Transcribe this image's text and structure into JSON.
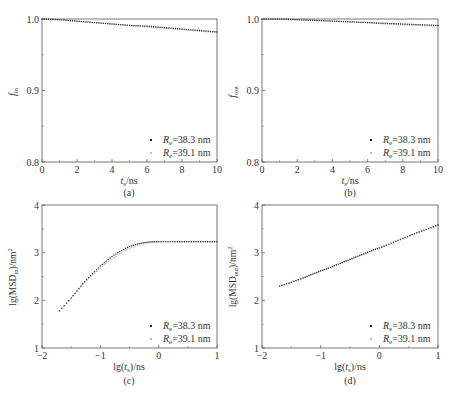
{
  "chart_data": [
    {
      "id": "a",
      "type": "scatter",
      "panel_label": "(a)",
      "title": "",
      "xlabel": "t_s/ns",
      "ylabel": "f_in",
      "xlim": [
        0,
        10
      ],
      "ylim": [
        0.8,
        1.0
      ],
      "xticks": [
        0,
        2,
        4,
        6,
        8,
        10
      ],
      "xtick_labels": [
        "0",
        "2",
        "4",
        "6",
        "8",
        "10"
      ],
      "yticks": [
        0.8,
        0.9,
        1.0
      ],
      "ytick_labels": [
        "0.8",
        "0.9",
        "1.0"
      ],
      "grid": false,
      "legend_position": "lower right",
      "series": [
        {
          "name": "R_e=38.3 nm",
          "color": "#222222",
          "x": [
            0,
            1,
            2,
            3,
            4,
            5,
            6,
            7,
            8,
            9,
            10
          ],
          "y": [
            1.0,
            0.999,
            0.997,
            0.995,
            0.993,
            0.991,
            0.99,
            0.988,
            0.986,
            0.984,
            0.982
          ]
        },
        {
          "name": "R_e=39.1 nm",
          "color": "#aaaaaa",
          "x": [
            0,
            1,
            2,
            3,
            4,
            5,
            6,
            7,
            8,
            9,
            10
          ],
          "y": [
            1.0,
            0.999,
            0.997,
            0.995,
            0.993,
            0.991,
            0.989,
            0.987,
            0.985,
            0.983,
            0.981
          ]
        }
      ]
    },
    {
      "id": "b",
      "type": "scatter",
      "panel_label": "(b)",
      "title": "",
      "xlabel": "t_s/ns",
      "ylabel": "f_out",
      "xlim": [
        0,
        10
      ],
      "ylim": [
        0.8,
        1.0
      ],
      "xticks": [
        0,
        2,
        4,
        6,
        8,
        10
      ],
      "xtick_labels": [
        "0",
        "2",
        "4",
        "6",
        "8",
        "10"
      ],
      "yticks": [
        0.8,
        0.9,
        1.0
      ],
      "ytick_labels": [
        "0.8",
        "0.9",
        "1.0"
      ],
      "grid": false,
      "legend_position": "lower right",
      "series": [
        {
          "name": "R_e=38.3 nm",
          "color": "#222222",
          "x": [
            0,
            1,
            2,
            3,
            4,
            5,
            6,
            7,
            8,
            9,
            10
          ],
          "y": [
            1.0,
            1.0,
            0.999,
            0.998,
            0.997,
            0.996,
            0.995,
            0.994,
            0.993,
            0.992,
            0.991
          ]
        },
        {
          "name": "R_e=39.1 nm",
          "color": "#aaaaaa",
          "x": [
            0,
            1,
            2,
            3,
            4,
            5,
            6,
            7,
            8,
            9,
            10
          ],
          "y": [
            1.0,
            1.0,
            0.999,
            0.998,
            0.997,
            0.996,
            0.995,
            0.993,
            0.992,
            0.991,
            0.99
          ]
        }
      ]
    },
    {
      "id": "c",
      "type": "scatter",
      "panel_label": "(c)",
      "title": "",
      "xlabel": "lg(t_s)/ns",
      "ylabel": "lg(MSD_in)/nm^2",
      "xlim": [
        -2,
        1
      ],
      "ylim": [
        1,
        4
      ],
      "xticks": [
        -2,
        -1,
        0,
        1
      ],
      "xtick_labels": [
        "−2",
        "−1",
        "0",
        "1"
      ],
      "yticks": [
        1,
        2,
        3,
        4
      ],
      "ytick_labels": [
        "1",
        "2",
        "3",
        "4"
      ],
      "grid": false,
      "legend_position": "lower right",
      "series": [
        {
          "name": "R_e=38.3 nm",
          "color": "#222222",
          "x": [
            -1.7,
            -1.5,
            -1.4,
            -1.3,
            -1.2,
            -1.1,
            -1.0,
            -0.9,
            -0.8,
            -0.7,
            -0.6,
            -0.5,
            -0.4,
            -0.3,
            -0.2,
            -0.1,
            0.0,
            0.2,
            0.4,
            0.6,
            0.8,
            1.0
          ],
          "y": [
            1.78,
            2.05,
            2.2,
            2.35,
            2.48,
            2.6,
            2.72,
            2.82,
            2.92,
            3.0,
            3.07,
            3.13,
            3.17,
            3.2,
            3.22,
            3.23,
            3.23,
            3.23,
            3.23,
            3.23,
            3.23,
            3.23
          ]
        },
        {
          "name": "R_e=39.1 nm",
          "color": "#aaaaaa",
          "x": [
            -1.7,
            -1.5,
            -1.4,
            -1.3,
            -1.2,
            -1.1,
            -1.0,
            -0.9,
            -0.8,
            -0.7,
            -0.6,
            -0.5,
            -0.4,
            -0.3,
            -0.2,
            -0.1,
            0.0,
            0.2,
            0.4,
            0.6,
            0.8,
            1.0
          ],
          "y": [
            1.78,
            2.04,
            2.19,
            2.33,
            2.46,
            2.57,
            2.68,
            2.78,
            2.87,
            2.95,
            3.03,
            3.09,
            3.14,
            3.18,
            3.21,
            3.22,
            3.23,
            3.23,
            3.23,
            3.23,
            3.23,
            3.23
          ]
        }
      ]
    },
    {
      "id": "d",
      "type": "scatter",
      "panel_label": "(d)",
      "title": "",
      "xlabel": "lg(t_s)/ns",
      "ylabel": "lg(MSD_out)/nm^2",
      "xlim": [
        -2,
        1
      ],
      "ylim": [
        1,
        4
      ],
      "xticks": [
        -2,
        -1,
        0,
        1
      ],
      "xtick_labels": [
        "−2",
        "−1",
        "0",
        "1"
      ],
      "yticks": [
        1,
        2,
        3,
        4
      ],
      "ytick_labels": [
        "1",
        "2",
        "3",
        "4"
      ],
      "grid": false,
      "legend_position": "lower right",
      "series": [
        {
          "name": "R_e=38.3 nm",
          "color": "#222222",
          "x": [
            -1.7,
            -1.5,
            -1.3,
            -1.2,
            -1.1,
            -1.0,
            -0.9,
            -0.8,
            -0.7,
            -0.6,
            -0.5,
            -0.4,
            -0.3,
            -0.2,
            -0.1,
            0.0,
            0.2,
            0.4,
            0.6,
            0.8,
            1.0
          ],
          "y": [
            2.3,
            2.38,
            2.47,
            2.52,
            2.57,
            2.62,
            2.66,
            2.71,
            2.76,
            2.81,
            2.86,
            2.91,
            2.96,
            3.01,
            3.06,
            3.1,
            3.2,
            3.3,
            3.4,
            3.49,
            3.58
          ]
        },
        {
          "name": "R_e=39.1 nm",
          "color": "#aaaaaa",
          "x": [
            -1.7,
            -1.5,
            -1.3,
            -1.2,
            -1.1,
            -1.0,
            -0.9,
            -0.8,
            -0.7,
            -0.6,
            -0.5,
            -0.4,
            -0.3,
            -0.2,
            -0.1,
            0.0,
            0.2,
            0.4,
            0.6,
            0.8,
            1.0
          ],
          "y": [
            2.3,
            2.37,
            2.46,
            2.51,
            2.56,
            2.61,
            2.65,
            2.7,
            2.75,
            2.8,
            2.85,
            2.9,
            2.95,
            3.0,
            3.05,
            3.09,
            3.19,
            3.29,
            3.39,
            3.48,
            3.57
          ]
        }
      ]
    }
  ],
  "panels": [
    {
      "label": "(a)",
      "xlabel_main": "t",
      "xlabel_sub": "s",
      "xlabel_tail": "/ns",
      "ylabel_main": "f",
      "ylabel_sub": "in",
      "ylabel_tail": "",
      "legend": [
        {
          "prefix": "R",
          "sub": "e",
          "text": "=38.3 nm"
        },
        {
          "prefix": "R",
          "sub": "e",
          "text": "=39.1 nm"
        }
      ]
    },
    {
      "label": "(b)",
      "xlabel_main": "t",
      "xlabel_sub": "s",
      "xlabel_tail": "/ns",
      "ylabel_main": "f",
      "ylabel_sub": "out",
      "ylabel_tail": "",
      "legend": [
        {
          "prefix": "R",
          "sub": "e",
          "text": "=38.3 nm"
        },
        {
          "prefix": "R",
          "sub": "e",
          "text": "=39.1 nm"
        }
      ]
    },
    {
      "label": "(c)",
      "xlabel_pre": "lg(",
      "xlabel_main": "t",
      "xlabel_sub": "s",
      "xlabel_tail": ")/ns",
      "ylabel_pre": "lg(MSD",
      "ylabel_sub": "in",
      "ylabel_tail": ")/nm",
      "ylabel_sup": "2",
      "legend": [
        {
          "prefix": "R",
          "sub": "e",
          "text": "=38.3 nm"
        },
        {
          "prefix": "R",
          "sub": "e",
          "text": "=39.1 nm"
        }
      ]
    },
    {
      "label": "(d)",
      "xlabel_pre": "lg(",
      "xlabel_main": "t",
      "xlabel_sub": "s",
      "xlabel_tail": ")/ns",
      "ylabel_pre": "lg(MSD",
      "ylabel_sub": "out",
      "ylabel_tail": ")/nm",
      "ylabel_sup": "2",
      "legend": [
        {
          "prefix": "R",
          "sub": "e",
          "text": "=38.3 nm"
        },
        {
          "prefix": "R",
          "sub": "e",
          "text": "=39.1 nm"
        }
      ]
    }
  ]
}
